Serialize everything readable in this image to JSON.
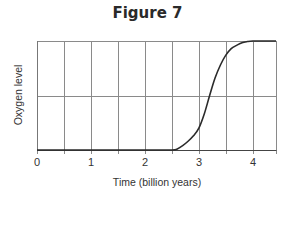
{
  "chart_data": {
    "type": "line",
    "title": "Figure 7",
    "xlabel": "Time (billion years)",
    "ylabel": "Oxygen level",
    "x_ticks": [
      "0",
      "1",
      "2",
      "3",
      "4"
    ],
    "x_tick_values": [
      0,
      1,
      2,
      3,
      4
    ],
    "xlim": [
      0,
      4.43
    ],
    "ylim": [
      0,
      1
    ],
    "grid": {
      "vertical_step": 0.5,
      "horizontal_lines": [
        0.5,
        1.0
      ]
    },
    "legend": null,
    "series": [
      {
        "name": "Oxygen level",
        "x": [
          0,
          0.5,
          1.0,
          1.5,
          2.0,
          2.5,
          2.6,
          2.7,
          2.8,
          2.9,
          3.0,
          3.1,
          3.2,
          3.3,
          3.4,
          3.5,
          3.6,
          3.7,
          3.8,
          3.9,
          4.0,
          4.2,
          4.43
        ],
        "y": [
          0,
          0,
          0,
          0,
          0,
          0,
          0.01,
          0.04,
          0.08,
          0.13,
          0.2,
          0.33,
          0.5,
          0.66,
          0.78,
          0.87,
          0.93,
          0.96,
          0.985,
          0.995,
          1.0,
          1.0,
          1.0
        ]
      }
    ],
    "annotations": []
  },
  "figure": {
    "title": "Figure 7",
    "xlabel": "Time (billion years)",
    "ylabel": "Oxygen level",
    "ticks": [
      "0",
      "1",
      "2",
      "3",
      "4"
    ]
  }
}
